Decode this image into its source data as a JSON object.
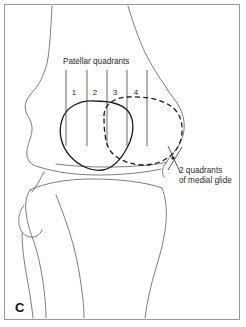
{
  "figure": {
    "panel_letter": "C",
    "background_color": "#ffffff",
    "frame_color": "#9a9a9a",
    "bone_line_color": "#6e6e6e",
    "patella_line_color": "#1b1b1b",
    "quadrant_line_color": "#7c7c7c",
    "width": 246,
    "height": 327
  },
  "labels": {
    "quadrants_title": "Patellar quadrants",
    "callout_line1": "2 quadrants",
    "callout_line2": "of medial glide"
  },
  "quadrants": {
    "numbers": [
      "1",
      "2",
      "3",
      "4"
    ],
    "number_x": [
      76,
      97,
      117,
      137
    ],
    "number_y": 95,
    "divider_x": [
      66,
      87,
      107,
      127,
      147
    ],
    "divider_top": 70,
    "divider_bottom": 146
  },
  "anatomy": {
    "parts": [
      "femur-shaft",
      "femoral-condyle",
      "tibial-plateau",
      "tibia-shaft",
      "fibula-head",
      "fibula-shaft"
    ]
  },
  "patella": {
    "current_position_label": "patella-solid-outline",
    "glided_position_label": "patella-dashed-outline",
    "glide_direction": "medial",
    "glide_amount_quadrants": 2
  }
}
